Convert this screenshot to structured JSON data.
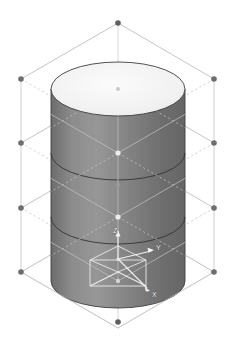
{
  "viewport": {
    "name": "isometric-3d-viewport",
    "background_color": "#ffffff",
    "width": 235,
    "height": 345,
    "projection": "isometric"
  },
  "model": {
    "name": "cylinder",
    "shape_type": "cylinder",
    "body_color": "#7e7e7e",
    "body_shade_dark": "#6a6a6a",
    "body_shade_light": "#9a9a9a",
    "top_cap_color": "#f2f2f2",
    "outline_color": "#3c3c3c",
    "center_x": 118,
    "top_cap_center_y": 89,
    "bottom_cap_center_y": 281,
    "radius_x": 67,
    "radius_y": 27,
    "section_lines_y": [
      153,
      217
    ]
  },
  "construction_grid": {
    "name": "isometric-lattice",
    "line_color": "#b9b9b9",
    "dashed_line_color": "#c8c8c8",
    "vertex_color": "#6e6e6e",
    "vertex_radius": 2.6,
    "levels": 4,
    "apex_top": {
      "x": 118,
      "y": 23
    },
    "apex_bottom": {
      "x": 118,
      "y": 322
    },
    "left_vertices_y": [
      79,
      143,
      208,
      272
    ],
    "right_vertices_y": [
      79,
      143,
      208,
      272
    ],
    "left_x": 21,
    "right_x": 214,
    "center_vertices": [
      {
        "x": 118,
        "y": 89,
        "color": "#cfcfcf"
      },
      {
        "x": 118,
        "y": 153,
        "color": "#e8e8e8"
      },
      {
        "x": 118,
        "y": 185,
        "color": "#9a9a9a"
      },
      {
        "x": 118,
        "y": 217,
        "color": "#e8e8e8"
      },
      {
        "x": 118,
        "y": 249,
        "color": "#9a9a9a"
      },
      {
        "x": 118,
        "y": 281,
        "color": "#d0d0d0"
      }
    ]
  },
  "axis_triad": {
    "name": "coordinate-axis-indicator",
    "origin": {
      "x": 118,
      "y": 258
    },
    "line_color": "#ffffff",
    "label_color": "#ffffff",
    "axes": [
      {
        "id": "z",
        "label": "Z",
        "label_x": 116,
        "label_y": 236,
        "arrow_x": 118,
        "arrow_y": 232
      },
      {
        "id": "y",
        "label": "Y",
        "label_x": 157,
        "label_y": 253,
        "arrow_x": 152,
        "arrow_y": 251
      },
      {
        "id": "x",
        "label": "X",
        "label_x": 154,
        "label_y": 293,
        "arrow_x": 148,
        "arrow_y": 288
      }
    ],
    "plane_box": {
      "name": "axis-plane-box",
      "half_w": 28,
      "half_h": 14,
      "height": 26
    }
  }
}
